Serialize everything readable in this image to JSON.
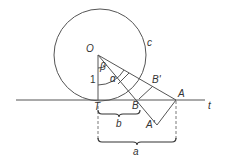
{
  "diagram": {
    "points": {
      "O": {
        "label": "O",
        "x": 98,
        "y": 55
      },
      "T": {
        "label": "T",
        "x": 98,
        "y": 100
      },
      "B": {
        "label": "B",
        "x": 139,
        "y": 100
      },
      "A": {
        "label": "A",
        "x": 176,
        "y": 100
      },
      "B_prime": {
        "label": "B'",
        "x": 153,
        "y": 86
      },
      "A_prime": {
        "label": "A'",
        "x": 157,
        "y": 125
      }
    },
    "circle": {
      "label": "c",
      "cx": 98,
      "cy": 55,
      "r": 45
    },
    "tangent_line": {
      "label": "t"
    },
    "angles": {
      "beta": "β",
      "alpha": "α"
    },
    "radius_label": "1",
    "measures": {
      "b": "b",
      "a": "a"
    }
  }
}
